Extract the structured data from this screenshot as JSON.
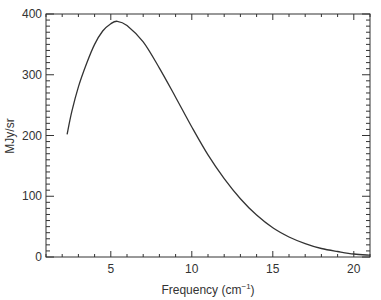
{
  "chart_data": {
    "type": "line",
    "title": "",
    "xlabel": "Frequency (cm⁻¹)",
    "xlabel_base": "Frequency (cm",
    "xlabel_sup": "−1",
    "xlabel_close": ")",
    "ylabel": "MJy/sr",
    "xlim": [
      1,
      21
    ],
    "ylim": [
      0,
      400
    ],
    "xticks": [
      5,
      10,
      15,
      20
    ],
    "xtick_labels": [
      "5",
      "10",
      "15",
      "20"
    ],
    "yticks": [
      0,
      100,
      200,
      300,
      400
    ],
    "ytick_labels": [
      "0",
      "100",
      "200",
      "300",
      "400"
    ],
    "x_minor_step": 1,
    "y_minor_step": 10,
    "grid": false,
    "legend": null,
    "series": [
      {
        "name": "spectrum",
        "color": "#333333",
        "x": [
          2.3,
          2.6,
          3.0,
          3.5,
          4.0,
          4.5,
          5.0,
          5.4,
          6.0,
          7.0,
          8.0,
          9.0,
          10.0,
          11.0,
          12.0,
          13.0,
          14.0,
          15.0,
          16.0,
          17.0,
          18.0,
          19.0,
          20.0,
          21.0
        ],
        "y": [
          202,
          240,
          280,
          318,
          350,
          372,
          384,
          388,
          381,
          354,
          311,
          263,
          214,
          168,
          129,
          96,
          69,
          48,
          33,
          22,
          14,
          9,
          5,
          3
        ]
      }
    ]
  }
}
